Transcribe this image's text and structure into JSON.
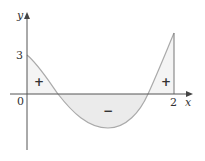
{
  "diagram": {
    "type": "signed-area-under-curve",
    "axes": {
      "x_label": "x",
      "y_label": "y",
      "origin_label": "0",
      "x_tick_label": "2",
      "y_tick_label": "3"
    },
    "region_signs": {
      "left": "+",
      "middle": "−",
      "right": "+"
    },
    "colors": {
      "axis": "#555555",
      "curve": "#aaaaaa",
      "shade": "#ebebeb",
      "text": "#333333"
    }
  }
}
